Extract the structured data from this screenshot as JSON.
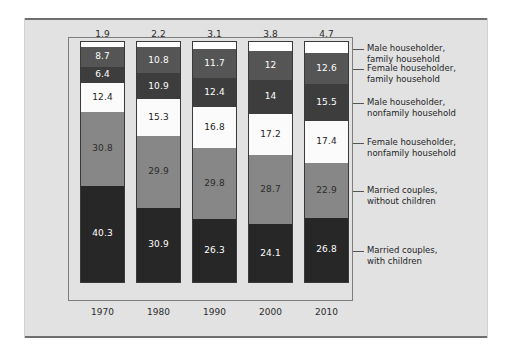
{
  "chart_data": {
    "type": "bar",
    "subtype": "stacked-bar-100-percent",
    "title": "",
    "xlabel": "",
    "ylabel": "",
    "ylim": [
      0,
      100
    ],
    "grid": false,
    "legend_position": "right",
    "categories": [
      "1970",
      "1980",
      "1990",
      "2000",
      "2010"
    ],
    "series": [
      {
        "name": "Married couples, with children",
        "label": "Married couples,\nwith children",
        "color": "#272727",
        "text_color": "#ffffff",
        "values": [
          40.3,
          30.9,
          26.3,
          24.1,
          26.8
        ],
        "labels": [
          "40.3",
          "30.9",
          "26.3",
          "24.1",
          "26.8"
        ]
      },
      {
        "name": "Married couples, without children",
        "label": "Married couples,\nwithout children",
        "color": "#878787",
        "text_color": "#2b2b2b",
        "values": [
          30.8,
          29.9,
          29.8,
          28.7,
          22.9
        ],
        "labels": [
          "30.8",
          "29.9",
          "29.8",
          "28.7",
          "22.9"
        ]
      },
      {
        "name": "Female householder, nonfamily household",
        "label": "Female householder,\nnonfamily household",
        "color": "#fbfbfb",
        "text_color": "#1e1e1e",
        "values": [
          12.4,
          15.3,
          16.8,
          17.2,
          17.4
        ],
        "labels": [
          "12.4",
          "15.3",
          "16.8",
          "17.2",
          "17.4"
        ]
      },
      {
        "name": "Male householder, nonfamily household",
        "label": "Male householder,\nnonfamily household",
        "color": "#3d3d3d",
        "text_color": "#ffffff",
        "values": [
          6.4,
          10.9,
          12.4,
          14,
          15.5
        ],
        "labels": [
          "6.4",
          "10.9",
          "12.4",
          "14",
          "15.5"
        ]
      },
      {
        "name": "Female householder, family household",
        "label": "Female householder,\nfamily household",
        "color": "#555555",
        "text_color": "#ffffff",
        "values": [
          8.7,
          10.8,
          11.7,
          12,
          12.6
        ],
        "labels": [
          "8.7",
          "10.8",
          "11.7",
          "12",
          "12.6"
        ]
      },
      {
        "name": "Male householder, family household",
        "label": "Male householder,\nfamily household",
        "color": "#ffffff",
        "text_color": "#1e1e1e",
        "values": [
          1.9,
          2.2,
          3.1,
          3.8,
          4.7
        ],
        "labels": [
          "1.9",
          "2.2",
          "3.1",
          "3.8",
          "4.7"
        ],
        "value_label_above_bar": true
      }
    ],
    "top_labels": [
      "1.9",
      "2.2",
      "3.1",
      "3.8",
      "4.7"
    ]
  },
  "colors": {
    "page_background": "#ffffff",
    "panel_background": "#e2e2e2",
    "panel_rule": "#6f6f6f",
    "plot_border": "#7d7d7d",
    "bar_outline": "#3a3a3a",
    "legend_text": "#1f1f1f"
  }
}
